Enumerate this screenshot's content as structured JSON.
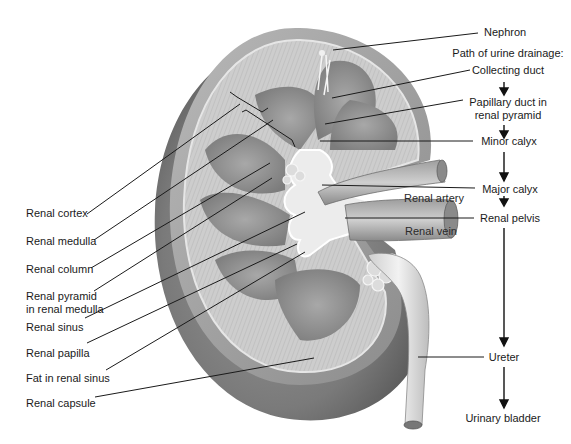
{
  "diagram": {
    "left_labels": [
      {
        "id": "renal-cortex",
        "text": "Renal cortex"
      },
      {
        "id": "renal-medulla",
        "text": "Renal medulla"
      },
      {
        "id": "renal-column",
        "text": "Renal column"
      },
      {
        "id": "renal-pyramid",
        "line1": "Renal pyramid",
        "line2": "in renal medulla"
      },
      {
        "id": "renal-sinus",
        "text": "Renal sinus"
      },
      {
        "id": "renal-papilla",
        "text": "Renal papilla"
      },
      {
        "id": "fat-in-renal-sinus",
        "text": "Fat in renal sinus"
      },
      {
        "id": "renal-capsule",
        "text": "Renal capsule"
      }
    ],
    "right_labels": {
      "nephron": "Nephron",
      "path_heading": "Path of urine drainage:",
      "path_steps": [
        {
          "id": "collecting-duct",
          "text": "Collecting duct"
        },
        {
          "id": "papillary-duct",
          "line1": "Papillary duct in",
          "line2": "renal pyramid"
        },
        {
          "id": "minor-calyx",
          "text": "Minor calyx"
        },
        {
          "id": "major-calyx",
          "text": "Major calyx"
        },
        {
          "id": "renal-pelvis",
          "text": "Renal pelvis"
        },
        {
          "id": "ureter",
          "text": "Ureter"
        },
        {
          "id": "urinary-bladder",
          "text": "Urinary bladder"
        }
      ]
    },
    "in_art_labels": {
      "renal_artery": "Renal artery",
      "renal_vein": "Renal vein"
    },
    "colors": {
      "background": "#ffffff",
      "capsule_dark": "#6e6e6e",
      "cortex": "#c9c9c9",
      "pyramid": "#8f8f8f",
      "sinus_light": "#e8e8e8",
      "leader_line": "#1a1a1a"
    }
  }
}
